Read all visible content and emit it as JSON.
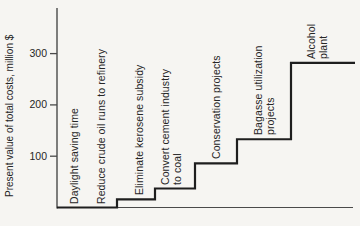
{
  "figure": {
    "background_color": "#f6f5f2",
    "line_color": "#1e1e1e",
    "axis_color": "#4a4a4a",
    "text_color": "#262626"
  },
  "chart_data": {
    "type": "line",
    "step": true,
    "title": "",
    "xlabel": "",
    "ylabel": "Present value of total costs, million $",
    "categories": [
      "Daylight saving time",
      "Reduce crude oil runs to refinery",
      "Eliminate kerosene subsidy",
      "Convert cement industry\nto coal",
      "Conservation projects",
      "Bagasse utilization\nprojects",
      "Alcohol\nplant"
    ],
    "values": [
      0,
      0,
      16,
      37,
      86,
      133,
      282
    ],
    "yticks": [
      100,
      200,
      300
    ],
    "ylim": [
      0,
      389
    ],
    "grid": false,
    "legend": "none"
  }
}
